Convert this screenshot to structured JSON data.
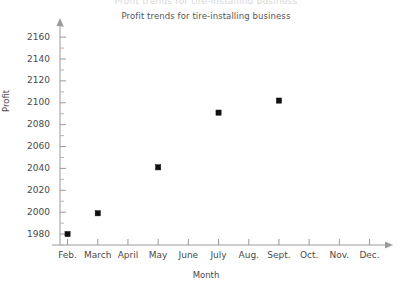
{
  "page": {
    "clipped_top_text": "Profit trends for tire-installing business"
  },
  "chart_data": {
    "type": "scatter",
    "title": "Profit trends for tire-installing business",
    "xlabel": "Month",
    "ylabel": "Profit",
    "categories": [
      "Feb.",
      "March",
      "April",
      "May",
      "June",
      "July",
      "Aug.",
      "Sept.",
      "Oct.",
      "Nov.",
      "Dec."
    ],
    "points": [
      {
        "x": "Feb.",
        "y": 1980
      },
      {
        "x": "March",
        "y": 1999
      },
      {
        "x": "May",
        "y": 2041
      },
      {
        "x": "July",
        "y": 2091
      },
      {
        "x": "Sept.",
        "y": 2102
      }
    ],
    "yticks": [
      1980,
      2000,
      2020,
      2040,
      2060,
      2080,
      2100,
      2120,
      2140,
      2160
    ],
    "ylim": [
      1970,
      2172
    ],
    "y_minor_step": 10,
    "grid": false,
    "legend": null,
    "marker": "square",
    "marker_color": "#111111",
    "axis_color": "#9a9a9a",
    "background": "#ffffff"
  }
}
